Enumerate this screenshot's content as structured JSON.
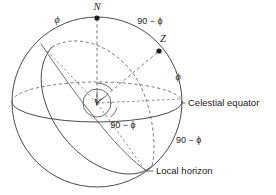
{
  "figure": {
    "background_color": "#ffffff",
    "line_color": "#4a4a4a",
    "dash_color": "#6b6b6b",
    "point_color": "#1c1c1c",
    "width": 276,
    "height": 195
  },
  "points": [
    {
      "id": "north-celestial-pole",
      "label": "N",
      "x": 97,
      "y": 18
    },
    {
      "id": "zenith",
      "label": "Z",
      "x": 159,
      "y": 51
    },
    {
      "id": "observer",
      "label": "V",
      "x": 97,
      "y": 103
    }
  ],
  "labels": {
    "north_pole": "N",
    "zenith": "Z",
    "observer": "V",
    "celestial_equator": "Celestial equator",
    "local_horizon": "Local horizon",
    "phi_top_left": "ϕ",
    "phi_right": "ϕ",
    "angle_top_right": "90 − ϕ",
    "angle_center_below": "90 − ϕ",
    "angle_lower_right": "90 − ϕ"
  },
  "annotations": [
    {
      "id": "phi-top-left",
      "text": "ϕ",
      "x": 57,
      "y": 21,
      "anchor": "middle",
      "style": "phi"
    },
    {
      "id": "angle-top-right",
      "text": "90 − ϕ",
      "x": 150,
      "y": 22,
      "anchor": "middle",
      "style": "angle"
    },
    {
      "id": "phi-right",
      "text": "ϕ",
      "x": 178,
      "y": 78,
      "anchor": "middle",
      "style": "phi"
    },
    {
      "id": "angle-below-center",
      "text": "90 − ϕ",
      "x": 123,
      "y": 126,
      "anchor": "middle",
      "style": "angle"
    },
    {
      "id": "angle-lower-right",
      "text": "90 − ϕ",
      "x": 176,
      "y": 141,
      "anchor": "start",
      "style": "angle"
    },
    {
      "id": "celestial-equator",
      "text": "Celestial equator",
      "x": 187,
      "y": 103,
      "anchor": "start",
      "style": "text"
    },
    {
      "id": "local-horizon",
      "text": "Local horizon",
      "x": 155,
      "y": 171,
      "anchor": "start",
      "style": "text"
    }
  ],
  "geometry": {
    "sphere": {
      "cx": 97,
      "cy": 102,
      "r": 85
    },
    "observer_circle": {
      "cx": 97,
      "cy": 103,
      "r": 14
    },
    "celestial_equator": {
      "cx": 97,
      "cy": 102,
      "rx": 85,
      "ry": 20
    },
    "local_horizon": {
      "cx": 97,
      "cy": 102,
      "rx": 85,
      "ry": 22,
      "rotation_deg": -58
    }
  }
}
